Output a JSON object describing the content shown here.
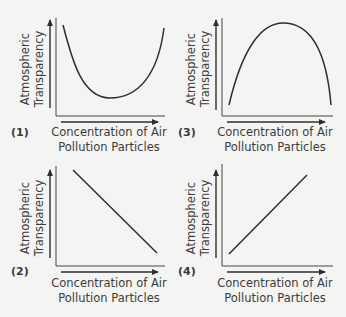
{
  "figure": {
    "type": "diagram",
    "line_color": "#2e2e2e",
    "background": "#f4f4f2"
  },
  "panels": [
    {
      "number": "(1)",
      "y_label_line1": "Atmospheric",
      "y_label_line2": "Transparency",
      "x_label_line1": "Concentration of Air",
      "x_label_line2": "Pollution Particles",
      "shape": "U-shaped curve (decreases then increases)"
    },
    {
      "number": "(2)",
      "y_label_line1": "Atmospheric",
      "y_label_line2": "Transparency",
      "x_label_line1": "Concentration of Air",
      "x_label_line2": "Pollution Particles",
      "shape": "straight line decreasing"
    },
    {
      "number": "(3)",
      "y_label_line1": "Atmospheric",
      "y_label_line2": "Transparency",
      "x_label_line1": "Concentration of Air",
      "x_label_line2": "Pollution Particles",
      "shape": "inverted U-shaped curve (increases then decreases)"
    },
    {
      "number": "(4)",
      "y_label_line1": "Atmospheric",
      "y_label_line2": "Transparency",
      "x_label_line1": "Concentration of Air",
      "x_label_line2": "Pollution Particles",
      "shape": "straight line increasing"
    }
  ]
}
